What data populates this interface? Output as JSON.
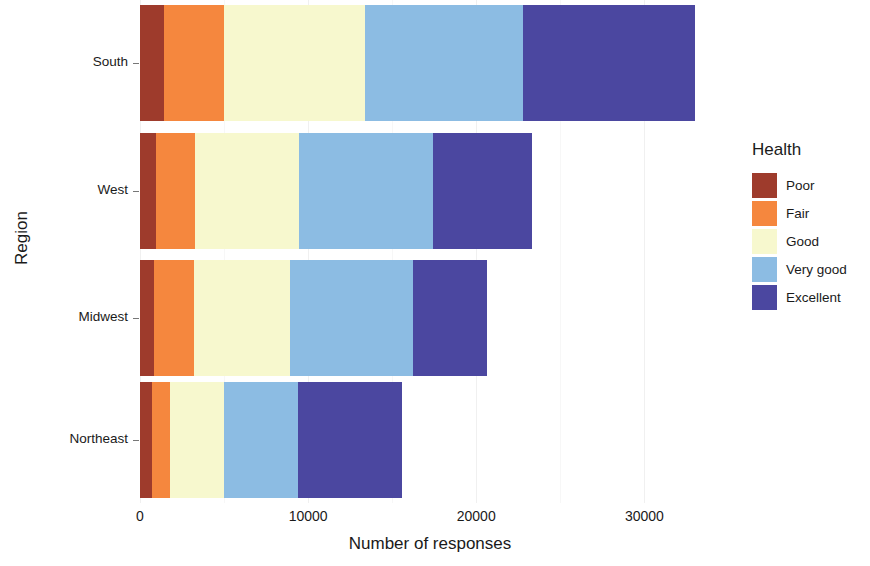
{
  "chart_data": {
    "type": "bar",
    "orientation": "horizontal",
    "stacked": true,
    "title": "",
    "xlabel": "Number of responses",
    "ylabel": "Region",
    "categories": [
      "South",
      "West",
      "Midwest",
      "Northeast"
    ],
    "series": [
      {
        "name": "Poor",
        "color": "#9E3B2C",
        "values": [
          1400,
          950,
          850,
          700
        ]
      },
      {
        "name": "Fair",
        "color": "#F5873E",
        "values": [
          3600,
          2350,
          2350,
          1100
        ]
      },
      {
        "name": "Good",
        "color": "#F7F8CE",
        "values": [
          8400,
          6150,
          5700,
          3200
        ]
      },
      {
        "name": "Very good",
        "color": "#8CBCE3",
        "values": [
          9400,
          8000,
          7350,
          4400
        ]
      },
      {
        "name": "Excellent",
        "color": "#4B47A0",
        "values": [
          10200,
          5850,
          4400,
          6200
        ]
      }
    ],
    "totals": [
      33000,
      23300,
      20650,
      15600
    ],
    "xlim": [
      0,
      34500
    ],
    "xticks": [
      0,
      10000,
      20000,
      30000
    ],
    "xtick_labels": [
      "0",
      "10000",
      "20000",
      "30000"
    ],
    "grid": "vertical-minor",
    "legend": {
      "title": "Health",
      "position": "right",
      "entries": [
        "Poor",
        "Fair",
        "Good",
        "Very good",
        "Excellent"
      ]
    }
  },
  "axes": {
    "y_title": "Region",
    "x_title": "Number of responses"
  }
}
